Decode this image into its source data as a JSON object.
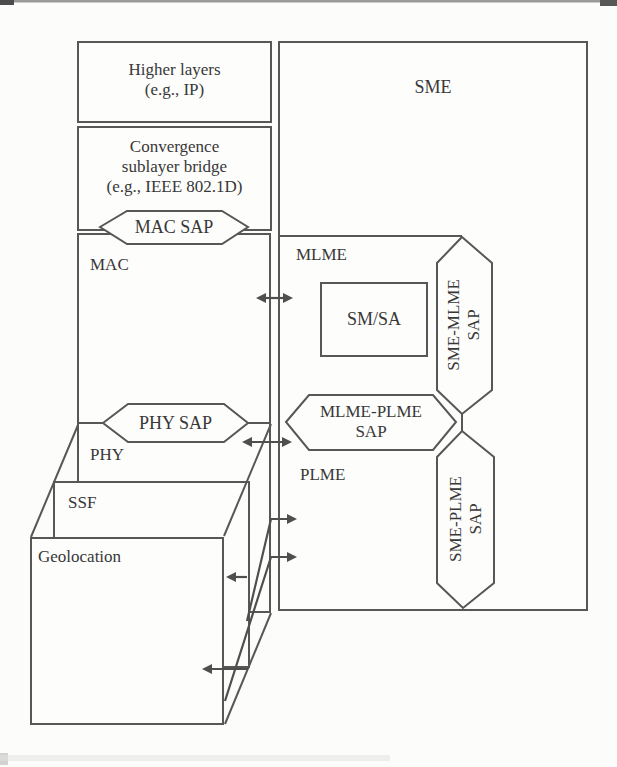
{
  "colors": {
    "line": "#575757",
    "text": "#383838",
    "background": "#fcfcfb"
  },
  "left_stack": {
    "higher_layers": {
      "line1": "Higher layers",
      "line2": "(e.g., IP)"
    },
    "convergence_sublayer": {
      "line1": "Convergence",
      "line2": "sublayer bridge",
      "line3": "(e.g., IEEE 802.1D)"
    },
    "mac_sap_label": "MAC SAP",
    "mac_label": "MAC",
    "phy_sap_label": "PHY SAP",
    "phy_label": "PHY",
    "ssf_label": "SSF",
    "geolocation_label": "Geolocation"
  },
  "management_plane": {
    "sme_label": "SME",
    "mlme_label": "MLME",
    "sm_sa_label": "SM/SA",
    "plme_label": "PLME",
    "sme_mlme_sap": {
      "line1": "SME-MLME",
      "line2": "SAP"
    },
    "mlme_plme_sap": {
      "line1": "MLME-PLME",
      "line2": "SAP"
    },
    "sme_plme_sap": {
      "line1": "SME-PLME",
      "line2": "SAP"
    }
  }
}
